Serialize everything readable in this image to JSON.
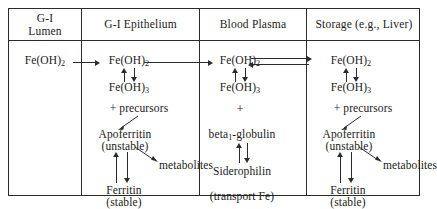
{
  "figure": {
    "columns": [
      {
        "id": "gi-lumen",
        "header_line1": "G-I",
        "header_line2": "Lumen"
      },
      {
        "id": "gi-epithelium",
        "header_line1": "G-I Epithelium",
        "header_line2": ""
      },
      {
        "id": "blood-plasma",
        "header_line1": "Blood Plasma",
        "header_line2": ""
      },
      {
        "id": "storage",
        "header_line1": "Storage (e.g., Liver)",
        "header_line2": ""
      }
    ],
    "labels": {
      "fe_oh_2": "Fe(OH)",
      "fe_oh_2_sub": "2",
      "fe_oh_3": "Fe(OH)",
      "fe_oh_3_sub": "3",
      "plus": "+",
      "plus_precursors": "+ precursors",
      "apoferritin": "Apoferritin",
      "apoferritin_state": "(unstable)",
      "ferritin": "Ferritin",
      "ferritin_state": "(stable)",
      "metabolites": "metabolites",
      "beta_globulin": "beta",
      "beta_globulin_sub": "1",
      "beta_globulin_rest": "-globulin",
      "siderophilin": "Siderophilin",
      "transport_fe": "(transport Fe)"
    },
    "colors": {
      "ink": "#1a1a1a",
      "rule": "#2b2b2b",
      "background": "#ffffff"
    }
  }
}
